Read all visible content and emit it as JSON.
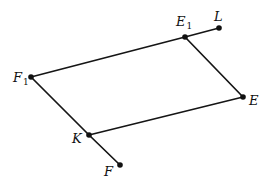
{
  "diagram": {
    "type": "geometry-parallelogram",
    "points": {
      "F1": {
        "x": 31,
        "y": 77,
        "label": "F",
        "subscript": "1"
      },
      "E1": {
        "x": 185,
        "y": 37,
        "label": "E",
        "subscript": "1"
      },
      "L": {
        "x": 219,
        "y": 28,
        "label": "L",
        "subscript": ""
      },
      "E": {
        "x": 243,
        "y": 97,
        "label": "E",
        "subscript": ""
      },
      "K": {
        "x": 89,
        "y": 135,
        "label": "K",
        "subscript": ""
      },
      "F": {
        "x": 120,
        "y": 165,
        "label": "F",
        "subscript": ""
      }
    },
    "segments": [
      [
        "F1",
        "E1"
      ],
      [
        "E1",
        "L"
      ],
      [
        "E1",
        "E"
      ],
      [
        "E",
        "K"
      ],
      [
        "F1",
        "K"
      ],
      [
        "K",
        "F"
      ]
    ],
    "colors": {
      "line": "#151515",
      "background": "#ffffff"
    }
  }
}
